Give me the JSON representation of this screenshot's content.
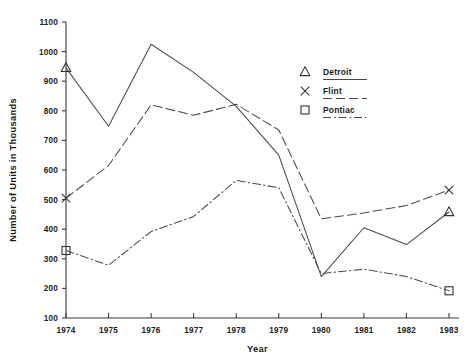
{
  "chart_data": {
    "type": "line",
    "title": "",
    "xlabel": "Year",
    "ylabel": "Number of Units in Thousands",
    "categories": [
      1974,
      1975,
      1976,
      1977,
      1978,
      1979,
      1980,
      1981,
      1982,
      1983
    ],
    "x_tick_labels": [
      "1974",
      "1975",
      "1976",
      "1977",
      "1978",
      "1979",
      "1980",
      "1981",
      "1982",
      "1983"
    ],
    "y_tick_labels": [
      "100",
      "200",
      "300",
      "400",
      "500",
      "600",
      "700",
      "800",
      "900",
      "1000",
      "1100"
    ],
    "y_ticks": [
      100,
      200,
      300,
      400,
      500,
      600,
      700,
      800,
      900,
      1000,
      1100
    ],
    "ylim": [
      100,
      1100
    ],
    "xlim": [
      1974,
      1983
    ],
    "grid": false,
    "legend_position": "top-right",
    "series": [
      {
        "name": "Detroit",
        "marker": "triangle",
        "line_style": "solid",
        "values": [
          945,
          748,
          1025,
          930,
          815,
          650,
          240,
          405,
          348,
          458
        ]
      },
      {
        "name": "Flint",
        "marker": "x",
        "line_style": "dashed",
        "values": [
          505,
          615,
          820,
          785,
          822,
          735,
          435,
          455,
          480,
          532
        ]
      },
      {
        "name": "Pontiac",
        "marker": "square",
        "line_style": "dash-dot",
        "values": [
          328,
          278,
          392,
          443,
          565,
          540,
          250,
          265,
          240,
          192
        ]
      }
    ]
  },
  "legend": {
    "entries": [
      {
        "label": "Detroit",
        "symbol": "triangle"
      },
      {
        "label": "Flint",
        "symbol": "x"
      },
      {
        "label": "Pontiac",
        "symbol": "square"
      }
    ]
  },
  "colors": {
    "line": "#4a4a4a",
    "axis": "#3a3a3a",
    "text": "#1a1a1a",
    "background": "#ffffff"
  }
}
